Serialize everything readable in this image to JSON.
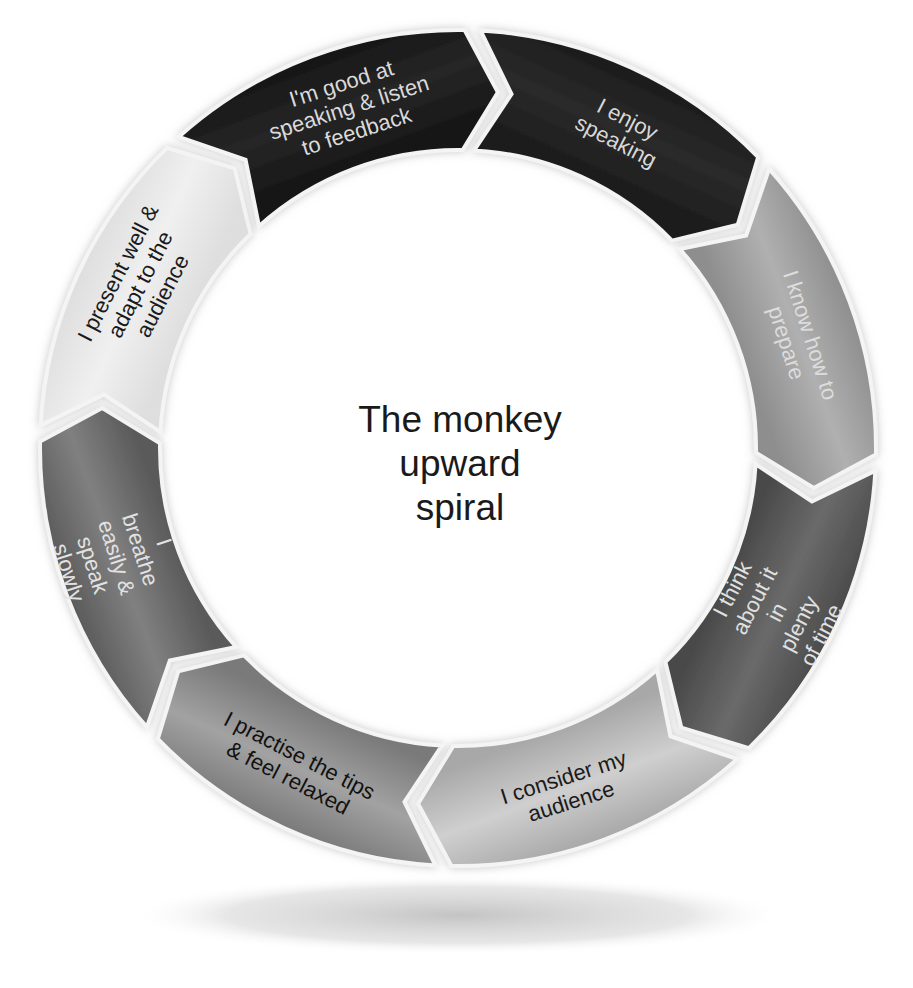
{
  "diagram": {
    "type": "cycle",
    "title_lines": [
      "The monkey",
      "upward",
      "spiral"
    ],
    "direction": "clockwise",
    "segments": [
      {
        "lines": [
          "I enjoy",
          "speaking"
        ],
        "fill": "#1c1c1c",
        "fill_light": "#2a2a2a",
        "text_color": "#d8d8d8"
      },
      {
        "lines": [
          "I know how to",
          "prepare"
        ],
        "fill": "#8e8e8e",
        "fill_light": "#b0b0b0",
        "text_color": "#dcdcdc"
      },
      {
        "lines": [
          "I think",
          "about it",
          "in",
          "plenty",
          "of time"
        ],
        "fill": "#4a4a4a",
        "fill_light": "#6a6a6a",
        "text_color": "#e0e0e0"
      },
      {
        "lines": [
          "I consider my",
          "audience"
        ],
        "fill": "#a8a8a8",
        "fill_light": "#cfcfcf",
        "text_color": "#1a1a1a"
      },
      {
        "lines": [
          "I practise the tips",
          "& feel relaxed"
        ],
        "fill": "#7a7a7a",
        "fill_light": "#a2a2a2",
        "text_color": "#111111"
      },
      {
        "lines": [
          "I",
          "breathe",
          "easily &",
          "speak",
          "slowly"
        ],
        "fill": "#5a5a5a",
        "fill_light": "#808080",
        "text_color": "#e2e2e2"
      },
      {
        "lines": [
          "I present well &",
          "adapt to the",
          "audience"
        ],
        "fill": "#dedede",
        "fill_light": "#f0f0f0",
        "text_color": "#1a1a1a"
      },
      {
        "lines": [
          "I'm good at",
          "speaking & listen",
          "to feedback"
        ],
        "fill": "#161616",
        "fill_light": "#262626",
        "text_color": "#dadada"
      }
    ]
  }
}
